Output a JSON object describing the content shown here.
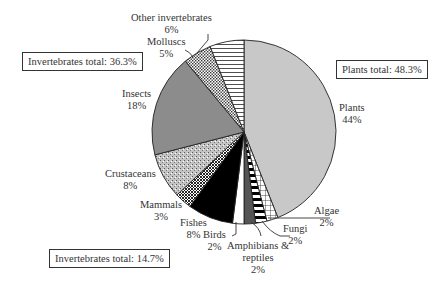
{
  "chart_data": {
    "type": "pie",
    "title": "",
    "start_angle_deg": 0,
    "direction": "clockwise",
    "slices": [
      {
        "label": "Plants",
        "value": 44,
        "pct": "44%",
        "fill": "#c8c8c8",
        "pattern": "solid-light-gray"
      },
      {
        "label": "Algae",
        "value": 2,
        "pct": "2%",
        "fill": "#ffffff",
        "pattern": "grid"
      },
      {
        "label": "Fungi",
        "value": 2,
        "pct": "2%",
        "fill": "#ffffff",
        "pattern": "black-white-bars"
      },
      {
        "label": "Amphibians & reptiles",
        "value": 2,
        "pct": "2%",
        "fill": "#555555",
        "pattern": "solid-dark-gray"
      },
      {
        "label": "Birds",
        "value": 2,
        "pct": "2%",
        "fill": "#ffffff",
        "pattern": "solid-white"
      },
      {
        "label": "Fishes",
        "value": 8,
        "pct": "8%",
        "fill": "#000000",
        "pattern": "solid-black"
      },
      {
        "label": "Mammals",
        "value": 3,
        "pct": "3%",
        "fill": "#444444",
        "pattern": "crosshatch"
      },
      {
        "label": "Crustaceans",
        "value": 8,
        "pct": "8%",
        "fill": "#b0b0b0",
        "pattern": "stipple"
      },
      {
        "label": "Insects",
        "value": 18,
        "pct": "18%",
        "fill": "#8c8c8c",
        "pattern": "solid-mid-gray"
      },
      {
        "label": "Molluscs",
        "value": 5,
        "pct": "5%",
        "fill": "#ffffff",
        "pattern": "dots"
      },
      {
        "label": "Other invertebrates",
        "value": 6,
        "pct": "6%",
        "fill": "#ffffff",
        "pattern": "horizontal-lines"
      }
    ],
    "annotations": [
      {
        "text": "Plants total: 48.3%"
      },
      {
        "text": "Invertebrates total: 36.3%"
      },
      {
        "text": "Invertebrates total: 14.7%"
      }
    ],
    "legend": "none (direct labels)"
  },
  "labels": {
    "plants": {
      "name": "Plants",
      "pct": "44%"
    },
    "algae": {
      "name": "Algae",
      "pct": "2%"
    },
    "fungi": {
      "name": "Fungi",
      "pct": "2%"
    },
    "amphibians": {
      "name1": "Amphibians &",
      "name2": "reptiles",
      "pct": "2%"
    },
    "birds": {
      "name": "Birds",
      "pct": "2%"
    },
    "fishes": {
      "name": "Fishes",
      "pct": "8%"
    },
    "mammals": {
      "name": "Mammals",
      "pct": "3%"
    },
    "crustaceans": {
      "name": "Crustaceans",
      "pct": "8%"
    },
    "insects": {
      "name": "Insects",
      "pct": "18%"
    },
    "molluscs": {
      "name": "Molluscs",
      "pct": "5%"
    },
    "other": {
      "name": "Other invertebrates",
      "pct": "6%"
    }
  },
  "boxes": {
    "plants_total": "Plants total: 48.3%",
    "invertebrates_total_upper": "Invertebrates total: 36.3%",
    "invertebrates_total_lower": "Invertebrates total: 14.7%"
  }
}
